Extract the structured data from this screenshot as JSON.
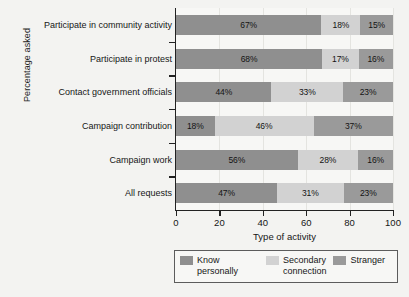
{
  "chart_data": {
    "type": "bar",
    "orientation": "horizontal",
    "stacked": true,
    "title": "",
    "xlabel": "Type of activity",
    "ylabel": "Percentage asked",
    "xlim": [
      0,
      100
    ],
    "xticks": [
      0,
      20,
      40,
      60,
      80,
      100
    ],
    "grid": true,
    "legend_position": "bottom",
    "categories": [
      "Participate in community activity",
      "Participate in protest",
      "Contact government officials",
      "Campaign contribution",
      "Campaign work",
      "All requests"
    ],
    "series": [
      {
        "name": "Know personally",
        "color": "#8f8f8f",
        "values": [
          67,
          68,
          44,
          18,
          56,
          47
        ],
        "labels": [
          "67%",
          "68%",
          "44%",
          "18%",
          "56%",
          "47%"
        ]
      },
      {
        "name": "Secondary connection",
        "color": "#d2d2d2",
        "values": [
          18,
          17,
          33,
          46,
          28,
          31
        ],
        "labels": [
          "18%",
          "17%",
          "33%",
          "46%",
          "28%",
          "31%"
        ]
      },
      {
        "name": "Stranger",
        "color": "#9a9a9a",
        "values": [
          15,
          16,
          23,
          37,
          16,
          23
        ],
        "labels": [
          "15%",
          "16%",
          "23%",
          "37%",
          "16%",
          "23%"
        ]
      }
    ],
    "legend_entries": [
      {
        "label": "Know personally",
        "color": "#8f8f8f"
      },
      {
        "label": "Secondary\nconnection",
        "color": "#d2d2d2"
      },
      {
        "label": "Stranger",
        "color": "#9a9a9a"
      }
    ],
    "xtick_labels": [
      "0",
      "20",
      "40",
      "60",
      "80",
      "100"
    ]
  }
}
